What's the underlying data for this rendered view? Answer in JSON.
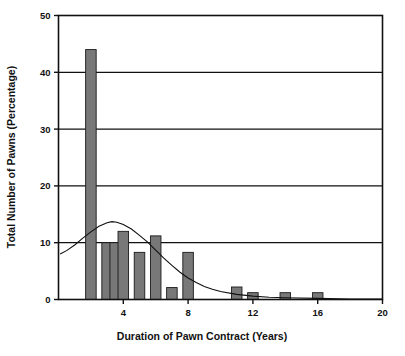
{
  "chart_data": {
    "type": "bar",
    "title": "",
    "xlabel": "Duration of Pawn Contract (Years)",
    "ylabel": "Total Number of Pawns (Percentage)",
    "xlim": [
      0,
      20
    ],
    "ylim": [
      0,
      50
    ],
    "grid": true,
    "legend": "none",
    "xticks": [
      4,
      8,
      12,
      16,
      20
    ],
    "yticks": [
      0,
      10,
      20,
      30,
      40,
      50
    ],
    "bar_color": "#787878",
    "bar_edge_color": "#1a1a1a",
    "curve_color": "#111111",
    "categories": [
      2,
      3,
      3.5,
      4,
      5,
      6,
      7,
      8,
      11,
      12,
      14,
      16
    ],
    "values": [
      44.0,
      10.0,
      10.0,
      12.0,
      8.3,
      11.2,
      2.1,
      8.3,
      2.2,
      1.2,
      1.2,
      1.2
    ],
    "bar_width_years": 0.65,
    "series": [
      {
        "name": "Total Number of Pawns (Percentage)",
        "type": "bar",
        "x": [
          2,
          3,
          3.5,
          4,
          5,
          6,
          7,
          8,
          11,
          12,
          14,
          16
        ],
        "values": [
          44.0,
          10.0,
          10.0,
          12.0,
          8.3,
          11.2,
          2.1,
          8.3,
          2.2,
          1.2,
          1.2,
          1.2
        ]
      },
      {
        "name": "fitted distribution curve",
        "type": "line",
        "x": [
          0.1,
          0.5,
          1.0,
          1.5,
          2.0,
          2.5,
          3.0,
          3.3,
          3.6,
          4.0,
          4.5,
          5.0,
          5.5,
          6.0,
          6.5,
          7.0,
          7.5,
          8.0,
          8.5,
          9.0,
          9.5,
          10.0,
          11.0,
          12.0,
          13.0,
          14.0,
          16.0,
          18.0,
          20.0
        ],
        "values": [
          8.0,
          8.6,
          9.6,
          10.8,
          11.9,
          12.9,
          13.5,
          13.7,
          13.6,
          13.2,
          12.4,
          11.3,
          10.1,
          8.7,
          7.3,
          6.0,
          4.8,
          3.8,
          3.0,
          2.3,
          1.8,
          1.4,
          0.9,
          0.6,
          0.4,
          0.3,
          0.2,
          0.1,
          0.1
        ]
      }
    ]
  },
  "axes": {
    "y_title": "Total Number of Pawns (Percentage)",
    "x_title": "Duration of Pawn Contract (Years)",
    "y_tick_labels": [
      "50",
      "40",
      "30",
      "20",
      "10",
      "0"
    ],
    "x_tick_labels": [
      "4",
      "8",
      "12",
      "16",
      "20"
    ]
  }
}
